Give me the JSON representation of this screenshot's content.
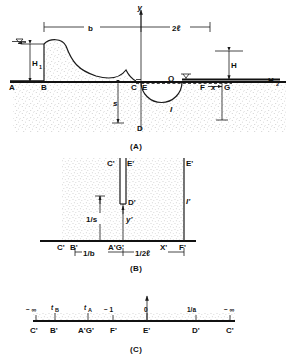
{
  "figure": {
    "title_semantic": "Seepage flow net and conformal mapping diagram",
    "panels": [
      {
        "id": "A",
        "caption": "(A)"
      },
      {
        "id": "B",
        "caption": "(B)"
      },
      {
        "id": "C",
        "caption": "(C)"
      }
    ]
  },
  "panel_a": {
    "caption": "(A)",
    "axis_y": "y",
    "axis_x_symbol": "x",
    "dim_b": "b",
    "dim_2l": "2ℓ",
    "dim_H1": "H",
    "dim_H1_sub": "1",
    "dim_H": "H",
    "dim_s": "s",
    "dim_x": "x",
    "label_H2": "H",
    "label_H2_sub": "2",
    "label_Q": "Q",
    "points": {
      "A": "A",
      "B": "B",
      "C": "C",
      "D": "D",
      "E": "E",
      "F": "F",
      "G": "G",
      "I": "I"
    },
    "icons": {
      "water_table_left": "water-table-icon",
      "water_table_right": "water-table-icon"
    }
  },
  "panel_b": {
    "caption": "(B)",
    "points": {
      "C_top": "C'",
      "E_top_inner": "E'",
      "E_top_right": "E'",
      "D": "D'",
      "I": "I'",
      "y": "y'",
      "C_bottom": "C'",
      "B": "B'",
      "AG": "A'G'",
      "X": "X'",
      "F": "F'"
    },
    "dim_inv_s": "1/s",
    "dim_inv_b": "1/b",
    "dim_inv_2l": "1/2ℓ"
  },
  "panel_c": {
    "caption": "(C)",
    "ticks_top": [
      {
        "label": "− ∞",
        "sub": ""
      },
      {
        "label": "t",
        "sub": "B"
      },
      {
        "label": "t",
        "sub": "A"
      },
      {
        "label": "− 1",
        "sub": ""
      },
      {
        "label": "0",
        "sub": ""
      },
      {
        "label": "1/a",
        "sub": ""
      },
      {
        "label": "− ∞",
        "sub": ""
      }
    ],
    "ticks_bottom": [
      "C'",
      "B'",
      "A'G'",
      "F'",
      "E'",
      "D'",
      "C'"
    ]
  },
  "colors": {
    "ink": "#111111",
    "line": "#1a1a1a",
    "paper": "#ffffff",
    "stipple": "#8a8a8a"
  }
}
